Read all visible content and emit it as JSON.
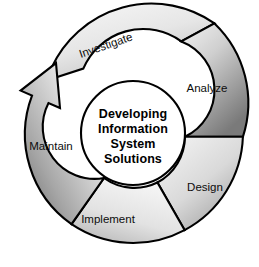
{
  "diagram": {
    "title": "Developing Information System Solutions",
    "type": "cyclic-spiral-process",
    "center": {
      "lines": [
        "Developing",
        "Information",
        "System",
        "Solutions"
      ]
    },
    "geometry": {
      "cx": 133,
      "cy": 133,
      "inner_radius": 52,
      "outer_radius": 110
    },
    "colors": {
      "background": "#ffffff",
      "outline": "#000000",
      "text": "#0d0d0d",
      "center_text": "#000000",
      "light_gray": "#ededed",
      "mid_gray": "#c9c9c9",
      "dark_gray": "#8f8f8f",
      "darkest_gray": "#6f6f6f"
    },
    "segments": [
      {
        "id": "investigate",
        "label": "Investigate",
        "order": 1,
        "start_angle": -126,
        "end_angle": -42,
        "label_x": 107,
        "label_y": 49,
        "label_rotation": -20,
        "shade_from": "#f2f2f2",
        "shade_to": "#c4c4c4"
      },
      {
        "id": "analyze",
        "label": "Analyze",
        "order": 2,
        "start_angle": -42,
        "end_angle": 2,
        "label_x": 207,
        "label_y": 91,
        "label_rotation": 0,
        "shade_from": "#efefef",
        "shade_to": "#808080"
      },
      {
        "id": "design",
        "label": "Design",
        "order": 3,
        "start_angle": 2,
        "end_angle": 62,
        "label_x": 205,
        "label_y": 190,
        "label_rotation": 0,
        "shade_from": "#f2f2f2",
        "shade_to": "#a8a8a8"
      },
      {
        "id": "implement",
        "label": "Implement",
        "order": 4,
        "start_angle": 62,
        "end_angle": 124,
        "label_x": 108,
        "label_y": 222,
        "label_rotation": 0,
        "shade_from": "#f4f4f4",
        "shade_to": "#c0c0c0"
      },
      {
        "id": "maintain",
        "label": "Maintain",
        "order": 5,
        "start_angle": 124,
        "end_angle": 196,
        "label_x": 51,
        "label_y": 149,
        "label_rotation": 0,
        "shade_from": "#fbfbfb",
        "shade_to": "#7d7d7d"
      }
    ],
    "arrow": {
      "name": "maintain-to-investigate-arrowhead",
      "description": "arrowhead terminating the Maintain segment pointing toward Investigate"
    }
  }
}
